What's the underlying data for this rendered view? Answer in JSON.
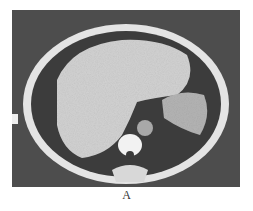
{
  "figure": {
    "caption": "A",
    "image_description": "Axial CT scan of upper abdomen showing enlarged liver, spleen, vertebra and aorta",
    "side_marker": "R"
  },
  "colors": {
    "background": "#4a4a4a",
    "body_outline": "#e8e8e8",
    "fat": "#3a3a3a",
    "liver": "#cfcfcf",
    "spleen": "#b0b0b0",
    "bone": "#f5f5f5"
  }
}
